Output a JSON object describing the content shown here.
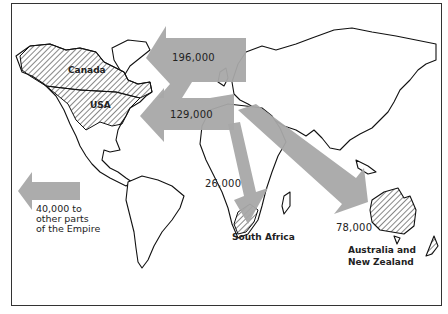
{
  "map": {
    "subject": "Emigration flows from Britain to the Empire",
    "colors": {
      "arrow": "#a8a8a8",
      "outline": "#111111",
      "background": "#ffffff",
      "frame": "#333333"
    },
    "regions": [
      {
        "id": "canada",
        "label": "Canada",
        "hatched": true
      },
      {
        "id": "usa",
        "label": "USA",
        "hatched": true
      },
      {
        "id": "south-africa",
        "label": "South Africa",
        "hatched": true
      },
      {
        "id": "australia-nz",
        "label": "Australia and New Zealand",
        "label_lines": [
          "Australia and",
          "New Zealand"
        ],
        "hatched": true
      }
    ],
    "flows": [
      {
        "destination": "Canada",
        "value": "196,000",
        "value_num": 196000
      },
      {
        "destination": "USA",
        "value": "129,000",
        "value_num": 129000
      },
      {
        "destination": "South Africa",
        "value": "26,000",
        "value_num": 26000
      },
      {
        "destination": "Australia and New Zealand",
        "value": "78,000",
        "value_num": 78000
      },
      {
        "destination": "other parts of the Empire",
        "value": "40,000",
        "value_num": 40000,
        "caption_lines": [
          "40,000 to",
          "other parts",
          "of the Empire"
        ]
      }
    ],
    "labels": {
      "canada": "Canada",
      "usa": "USA",
      "south_africa": "South Africa",
      "aus_line1": "Australia and",
      "aus_line2": "New Zealand",
      "flow_canada": "196,000",
      "flow_usa": "129,000",
      "flow_sa": "26,000",
      "flow_aus": "78,000",
      "other_line1": "40,000 to",
      "other_line2": "other parts",
      "other_line3": "of the Empire"
    }
  }
}
